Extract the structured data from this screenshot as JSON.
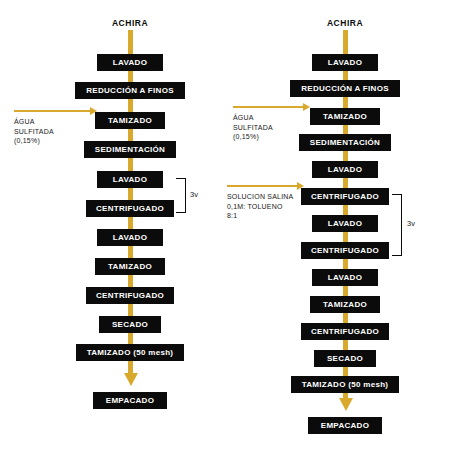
{
  "diagram": {
    "type": "process-flowchart",
    "background_color": "#FFFFFF",
    "node_color": "#0B0B0B",
    "node_text_color": "#FFFFFF",
    "flow_arrow_color": "#D9A92E",
    "bracket_color": "#0B0B0B"
  },
  "left_flow": {
    "title": "ACHIRA",
    "steps": [
      {
        "label": "LAVADO"
      },
      {
        "label": "REDUCCIÓN A FINOS"
      },
      {
        "label": "TAMIZADO"
      },
      {
        "label": "SEDIMENTACIÓN"
      },
      {
        "label": "LAVADO"
      },
      {
        "label": "CENTRIFUGADO"
      },
      {
        "label": "LAVADO"
      },
      {
        "label": "TAMIZADO"
      },
      {
        "label": "CENTRIFUGADO"
      },
      {
        "label": "SECADO"
      },
      {
        "label": "TAMIZADO (50 mesh)"
      },
      {
        "label": "EMPACADO"
      }
    ],
    "inputs": [
      {
        "line1": "ÁGUA",
        "line2": "SULFITADA",
        "line3": "(0,15%)"
      }
    ],
    "brackets": [
      {
        "label": "3v",
        "from": "LAVADO",
        "to": "CENTRIFUGADO"
      }
    ]
  },
  "right_flow": {
    "title": "ACHIRA",
    "steps": [
      {
        "label": "LAVADO"
      },
      {
        "label": "REDUCCIÓN A FINOS"
      },
      {
        "label": "TAMIZADO"
      },
      {
        "label": "SEDIMENTACIÓN"
      },
      {
        "label": "LAVADO"
      },
      {
        "label": "CENTRIFUGADO"
      },
      {
        "label": "LAVADO"
      },
      {
        "label": "CENTRIFUGADO"
      },
      {
        "label": "LAVADO"
      },
      {
        "label": "TAMIZADO"
      },
      {
        "label": "CENTRIFUGADO"
      },
      {
        "label": "SECADO"
      },
      {
        "label": "TAMIZADO (50 mesh)"
      },
      {
        "label": "EMPACADO"
      }
    ],
    "inputs": [
      {
        "line1": "ÁGUA",
        "line2": "SULFITADA",
        "line3": "(0,15%)"
      },
      {
        "line1": "SOLUCION SALINA",
        "line2": "0,1M: TOLUENO",
        "line3": "8:1"
      }
    ],
    "brackets": [
      {
        "label": "3v",
        "from": "CENTRIFUGADO",
        "to": "CENTRIFUGADO"
      }
    ]
  }
}
